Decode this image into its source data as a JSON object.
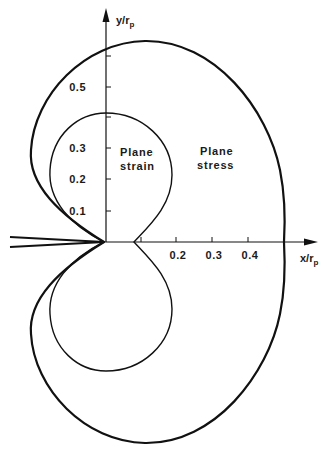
{
  "diagram": {
    "type": "plastic-zone-shape",
    "axes": {
      "x_label": "x/r",
      "x_label_subscript": "p",
      "y_label": "y/r",
      "y_label_subscript": "p",
      "x_ticks": [
        {
          "value": 0.1,
          "label": ""
        },
        {
          "value": 0.2,
          "label": "0.2"
        },
        {
          "value": 0.3,
          "label": "0.3"
        },
        {
          "value": 0.4,
          "label": "0.4"
        }
      ],
      "y_ticks": [
        {
          "value": 0.1,
          "label": "0.1"
        },
        {
          "value": 0.2,
          "label": "0.2"
        },
        {
          "value": 0.3,
          "label": "0.3"
        },
        {
          "value": 0.4,
          "label": ""
        },
        {
          "value": 0.5,
          "label": "0.5"
        },
        {
          "value": 0.6,
          "label": ""
        }
      ]
    },
    "regions": {
      "plane_strain_line1": "Plane",
      "plane_strain_line2": "strain",
      "plane_stress_line1": "Plane",
      "plane_stress_line2": "stress"
    },
    "colors": {
      "line": "#111111",
      "background": "#ffffff"
    }
  },
  "labels": {
    "t_y01": "0.1",
    "t_y02": "0.2",
    "t_y03": "0.3",
    "t_y05": "0.5",
    "t_x02": "0.2",
    "t_x03": "0.3",
    "t_x04": "0.4"
  }
}
